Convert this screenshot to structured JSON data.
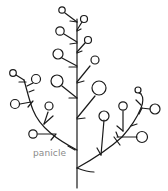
{
  "diagram": {
    "type": "botanical-inflorescence",
    "label": "panicle",
    "colors": {
      "stroke": "#1a1a1a",
      "label": "#8a8a8a",
      "background": "#ffffff"
    },
    "parts": {
      "main_stem": "main axis",
      "left_branch": "lower-left secondary branch",
      "right_branch": "lower-right secondary branch",
      "flowers": "terminal flower buds (circles)"
    }
  }
}
